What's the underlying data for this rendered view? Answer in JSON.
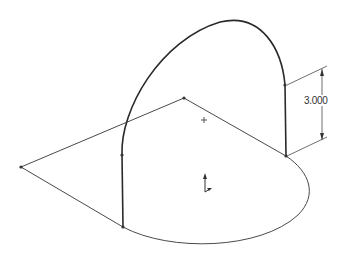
{
  "canvas": {
    "background": "#ffffff",
    "line_color": "#3a3a3a",
    "thin_line_color": "#4a4a4a"
  },
  "dimension": {
    "value": "3.000"
  },
  "icons": {
    "origin": "sketch-origin-icon",
    "center": "center-point-icon"
  }
}
